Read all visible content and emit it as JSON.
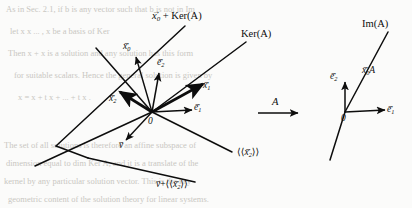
{
  "figure": {
    "background_color": "#fbfbfa",
    "ink_color": "#0d0d0d",
    "width": 412,
    "height": 208
  },
  "left_panel": {
    "origin_label": "0",
    "labels": {
      "x0_plus_ker": {
        "vec": "x",
        "sub": "0",
        "rest": " + Ker(A)"
      },
      "ker": "Ker(A)",
      "x0": {
        "vec": "x",
        "sub": "0"
      },
      "x1": {
        "vec": "x",
        "sub": "1"
      },
      "x2": {
        "vec": "x",
        "sub": "2"
      },
      "e1": {
        "vec": "e",
        "sub": "1"
      },
      "e2": {
        "vec": "e",
        "sub": "2"
      },
      "v": {
        "vec": "v"
      },
      "span_x2": {
        "open": "⟨⟨",
        "vec": "x",
        "sub": "2",
        "close": "⟩⟩"
      },
      "v_plus_span_x2": {
        "vvec": "v",
        "plus": "+",
        "open": "⟨⟨",
        "vec": "x",
        "sub": "2",
        "close": "⟩⟩"
      }
    }
  },
  "map_arrow": {
    "label": "A"
  },
  "right_panel": {
    "origin_label": "0",
    "labels": {
      "im": "Im(A)",
      "x0A": {
        "vec": "x",
        "sub": "0",
        "rest": "A"
      },
      "e1": {
        "vec": "e",
        "sub": "1"
      },
      "e2": {
        "vec": "e",
        "sub": "2"
      }
    }
  },
  "vector_accent": "→",
  "bleed_through": {
    "note": "faint reverse-side scan text",
    "lines": [
      "As in Sec. 2.1,  if  b  is any  vector  such  that  b  is not  in  Im",
      "let  x   x   ... ,  x   be  a  basis  of  Ker",
      "Then   x + x  is  a  solution  and  any  solution  has  this  form",
      "for  suitable  scalars.  Hence  the  general  solution  is  given  by",
      "x = x  + t  x  + ... + t  x   .",
      "The  set  of  all  solutions  is  therefore  an  affine  subspace  of",
      "dimension  equal  to  dim Ker A,  and  it  is  a  translate  of  the",
      "kernel  by  any  particular  solution  vector.   This  is  the  key",
      "geometric  content  of  the  solution  theory  for  linear  systems."
    ]
  }
}
